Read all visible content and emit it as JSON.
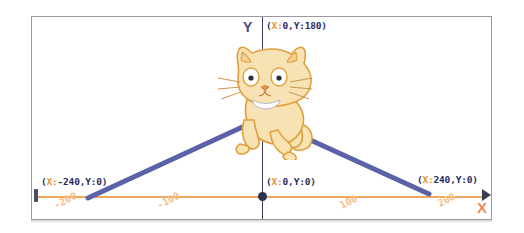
{
  "stage": {
    "width": 524,
    "height": 233,
    "background": "#ffffff",
    "frame_border_color": "#9a9a9e"
  },
  "axes": {
    "x_axis_label": "X",
    "y_axis_label": "Y",
    "x_axis_color": "#f0a860",
    "y_axis_color": "#3a3c58",
    "x_ticks": [
      "-200",
      "-100",
      "100",
      "200"
    ],
    "tick_color": "#f3c08a"
  },
  "annotations": {
    "top": {
      "open": "(",
      "key_x": "X:",
      "value_x": "0",
      "comma": ",",
      "key_y": "Y:",
      "value_y": "180",
      "close": ")"
    },
    "origin": {
      "open": "(",
      "key_x": "X:",
      "value_x": "0",
      "comma": ",",
      "key_y": "Y:",
      "value_y": "0",
      "close": ")"
    },
    "left": {
      "open": "(",
      "key_x": "X:",
      "value_x": "-240",
      "comma": ",",
      "key_y": "Y:",
      "value_y": "0",
      "close": ")"
    },
    "right": {
      "open": "(",
      "key_x": "X:",
      "value_x": "240",
      "comma": ",",
      "key_y": "Y:",
      "value_y": "0",
      "close": ")"
    }
  },
  "sprite": {
    "name": "scratch-cat",
    "body_color": "#f7e2b4",
    "outline_color": "#e0a03c"
  },
  "vectors": {
    "color": "#5c62a8",
    "stroke_width": 5,
    "left_line": {
      "x1": 262,
      "y1": 118,
      "x2": 88,
      "y2": 198
    },
    "right_line": {
      "x1": 262,
      "y1": 118,
      "x2": 429,
      "y2": 194
    }
  },
  "chart_data": {
    "type": "scatter",
    "xlabel": "X",
    "ylabel": "Y",
    "xlim": [
      -240,
      240
    ],
    "ylim": [
      -180,
      180
    ],
    "xticks": [
      -200,
      -100,
      100,
      200
    ],
    "grid": false,
    "points": [
      {
        "label": "(X:0,Y:180)",
        "x": 0,
        "y": 180
      },
      {
        "label": "(X:0,Y:0)",
        "x": 0,
        "y": 0
      },
      {
        "label": "(X:-240,Y:0)",
        "x": -240,
        "y": 0
      },
      {
        "label": "(X:240,Y:0)",
        "x": 240,
        "y": 0
      }
    ],
    "series": [
      {
        "name": "left-vector",
        "x": [
          0,
          -240
        ],
        "y": [
          60,
          -10
        ]
      },
      {
        "name": "right-vector",
        "x": [
          0,
          240
        ],
        "y": [
          60,
          0
        ]
      }
    ]
  }
}
